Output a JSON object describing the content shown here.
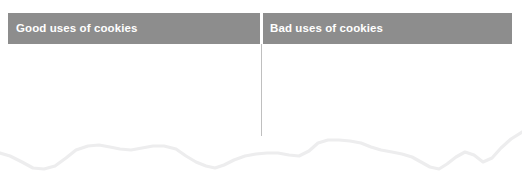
{
  "page": {
    "width": 522,
    "height": 178,
    "background_color": "#ffffff"
  },
  "table": {
    "header": {
      "background_color": "#8d8d8d",
      "text_color": "#ffffff",
      "columns": [
        {
          "id": "good-uses",
          "label": "Good uses of cookies"
        },
        {
          "id": "bad-uses",
          "label": "Bad uses of cookies"
        }
      ]
    },
    "divider": {
      "color": "#bfbfbf",
      "orientation": "vertical"
    },
    "body": {
      "rows": [],
      "empty": true
    }
  },
  "decoration": {
    "torn_edge": {
      "name": "wavy-bottom-edge",
      "color": "#ededee",
      "stroke_width": 3.2,
      "points": "0,153 10,156 22,162 33,168 44,169 55,166 66,158 76,150 88,146 99,145 110,147 120,149 131,150 142,148 153,146 164,146 176,149 186,156 196,162 206,166 215,168 224,165 234,160 245,156 256,154 267,153 278,153 289,155 299,156 309,151 318,143 328,140 339,140 350,141 361,143 371,147 381,150 392,152 402,154 412,157 421,162 430,167 439,169 447,164 456,157 465,152 474,155 483,162 492,158 501,148 511,139 522,132"
    }
  }
}
